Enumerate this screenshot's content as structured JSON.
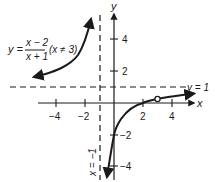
{
  "graph": {
    "equation": {
      "lhs": "y =",
      "numerator": "x − 2",
      "denominator": "x + 1",
      "condition": "(x ≠ 3)"
    },
    "axes": {
      "x_label": "x",
      "y_label": "y",
      "x_ticks": [
        "−4",
        "−2",
        "2",
        "4"
      ],
      "y_ticks": [
        "4",
        "2",
        "−2",
        "−4"
      ]
    },
    "asymptotes": {
      "horizontal_label": "y = 1",
      "vertical_label": "x = −1"
    },
    "hole": {
      "x": 3,
      "y": 0.25,
      "style": "open-circle"
    },
    "colors": {
      "ink": "#1a1a1a",
      "background": "#ffffff"
    }
  }
}
